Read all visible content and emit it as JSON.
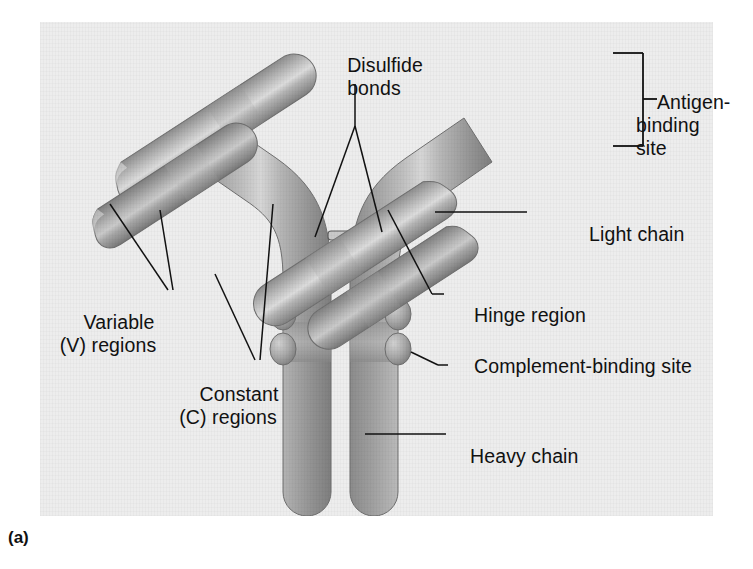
{
  "figure": {
    "caption": "(a)"
  },
  "colors": {
    "background": "#ededed",
    "page": "#ffffff",
    "protein_mid": "#a2a2a2",
    "protein_dark": "#7d7d7d",
    "protein_light": "#d9d9d9",
    "leader_line": "#111111",
    "text": "#111111"
  },
  "labels": {
    "disulfide_bonds": "Disulfide\nbonds",
    "antigen_binding_site": "Antigen-\nbinding\nsite",
    "light_chain": "Light chain",
    "hinge_region": "Hinge region",
    "complement_binding_site": "Complement-binding site",
    "heavy_chain": "Heavy chain",
    "variable_regions": "Variable\n(V) regions",
    "constant_regions": "Constant\n(C) regions"
  },
  "structure": {
    "chains": [
      {
        "name": "heavy-chain-left",
        "type": "heavy"
      },
      {
        "name": "heavy-chain-right",
        "type": "heavy"
      },
      {
        "name": "light-chain-left",
        "type": "light"
      },
      {
        "name": "light-chain-right",
        "type": "light"
      }
    ],
    "disulfide_bond_count": 2,
    "complement_binding_lobe_count": 4,
    "antigen_binding_site_count": 2
  }
}
